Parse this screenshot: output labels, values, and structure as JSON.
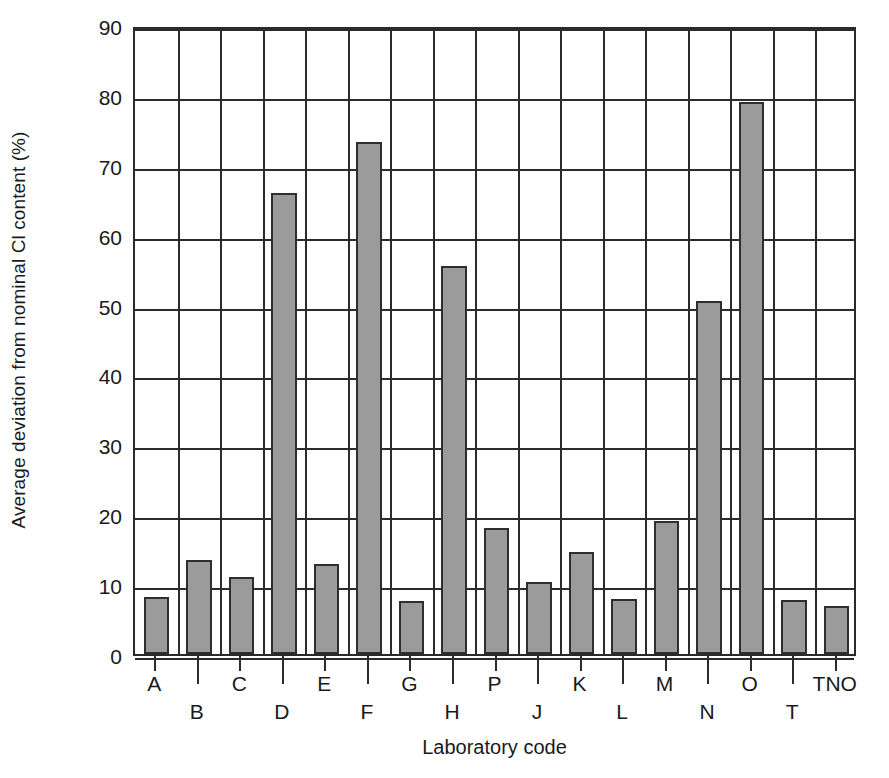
{
  "figure": {
    "top_caption_remnant": "",
    "background_color": "#ffffff",
    "bar_fill_color": "#9b9b9b",
    "bar_border_color": "#2e2e2e",
    "axis_color": "#2b2b2b"
  },
  "chart_data": {
    "type": "bar",
    "title": "",
    "xlabel": "Laboratory code",
    "ylabel": "Average deviation from nominal Cl content (%)",
    "categories": [
      "A",
      "B",
      "C",
      "D",
      "E",
      "F",
      "G",
      "H",
      "P",
      "J",
      "K",
      "L",
      "M",
      "N",
      "O",
      "T",
      "TNO"
    ],
    "values": [
      8.2,
      13.5,
      11.0,
      66.0,
      12.9,
      73.3,
      7.6,
      55.5,
      18.0,
      10.3,
      14.6,
      7.9,
      19.0,
      50.5,
      79.0,
      7.8,
      6.8
    ],
    "ylim": [
      0,
      90
    ],
    "yticks": [
      0,
      10,
      20,
      30,
      40,
      50,
      60,
      70,
      80,
      90
    ],
    "ytick_labels": [
      "0",
      "10",
      "20",
      "30",
      "40",
      "50",
      "60",
      "70",
      "80",
      "90"
    ],
    "grid": "both",
    "legend": "none",
    "label_stagger": [
      "top",
      "bottom",
      "top",
      "bottom",
      "top",
      "bottom",
      "top",
      "bottom",
      "top",
      "bottom",
      "top",
      "bottom",
      "top",
      "bottom",
      "top",
      "bottom",
      "top"
    ]
  }
}
